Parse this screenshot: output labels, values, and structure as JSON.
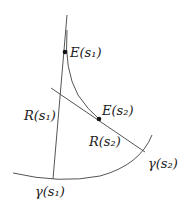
{
  "diagram": {
    "labels": {
      "E_s1": "E(s₁)",
      "E_s2": "E(s₂)",
      "R_s1": "R(s₁)",
      "R_s2": "R(s₂)",
      "gamma_s1": "γ(s₁)",
      "gamma_s2": "γ(s₂)"
    },
    "colors": {
      "line": "#555555",
      "dot": "#111111",
      "text": "#222222"
    }
  }
}
